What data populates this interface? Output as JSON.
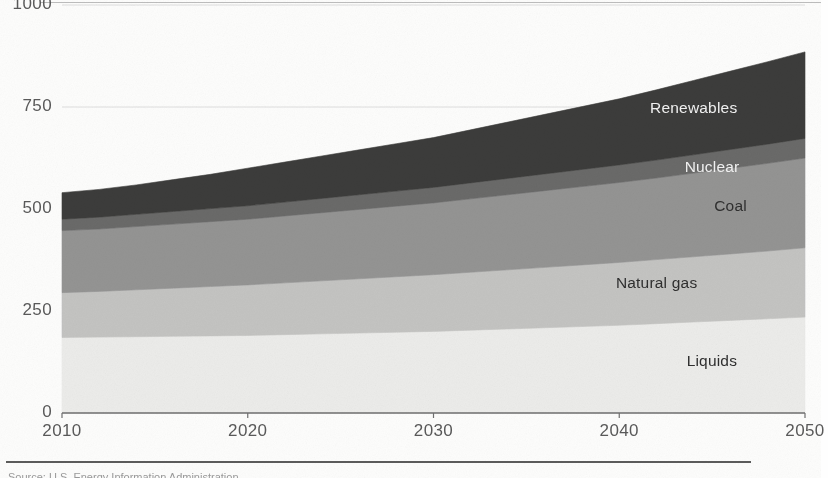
{
  "figure": {
    "source_note": "Source: U.S. Energy Information Administration",
    "background_color": "#fdfdfc"
  },
  "chart_data": {
    "type": "area",
    "stacked": true,
    "title": "",
    "subtitle": "",
    "xlabel": "",
    "ylabel": "",
    "xlim": [
      2010,
      2050
    ],
    "ylim": [
      0,
      1000
    ],
    "xticks": [
      2010,
      2020,
      2030,
      2040,
      2050
    ],
    "yticks": [
      0,
      250,
      500,
      750,
      1000
    ],
    "xtick_labels": [
      "2010",
      "2020",
      "2030",
      "2040",
      "2050"
    ],
    "ytick_labels": [
      "0",
      "250",
      "500",
      "750",
      "1000"
    ],
    "grid": "horizontal",
    "legend_position": "inline-right",
    "x": [
      2010,
      2012,
      2014,
      2016,
      2018,
      2020,
      2022,
      2024,
      2026,
      2028,
      2030,
      2032,
      2034,
      2036,
      2038,
      2040,
      2042,
      2044,
      2046,
      2048,
      2050
    ],
    "series": [
      {
        "name": "Liquids",
        "color": "#ececea",
        "label_color": "#2f2f2f",
        "values": [
          185,
          186,
          187,
          188,
          189,
          190,
          192,
          194,
          196,
          198,
          200,
          203,
          206,
          209,
          212,
          215,
          219,
          223,
          227,
          231,
          235
        ]
      },
      {
        "name": "Natural gas",
        "color": "#c4c4c2",
        "label_color": "#2f2f2f",
        "values": [
          110,
          112,
          115,
          118,
          121,
          124,
          127,
          130,
          133,
          136,
          139,
          142,
          145,
          148,
          151,
          154,
          157,
          160,
          163,
          166,
          170
        ]
      },
      {
        "name": "Coal",
        "color": "#949493",
        "label_color": "#2f2f2f",
        "values": [
          152,
          153,
          155,
          157,
          159,
          161,
          164,
          167,
          170,
          173,
          176,
          180,
          184,
          188,
          192,
          196,
          200,
          205,
          210,
          215,
          220
        ]
      },
      {
        "name": "Nuclear",
        "color": "#6a6a69",
        "label_color": "#f2f2f2",
        "values": [
          28,
          29,
          30,
          31,
          32,
          33,
          34,
          35,
          36,
          37,
          38,
          39,
          40,
          41,
          42,
          43,
          44,
          45,
          46,
          47,
          48
        ]
      },
      {
        "name": "Renewables",
        "color": "#3c3c3b",
        "label_color": "#f2f2f2",
        "values": [
          65,
          68,
          72,
          78,
          84,
          92,
          98,
          104,
          110,
          116,
          122,
          130,
          138,
          146,
          154,
          162,
          172,
          182,
          192,
          202,
          212
        ]
      }
    ],
    "totals": [
      540,
      548,
      559,
      572,
      585,
      600,
      615,
      630,
      645,
      660,
      675,
      694,
      713,
      732,
      751,
      770,
      792,
      815,
      838,
      861,
      885
    ],
    "series_label_positions": [
      {
        "name": "Renewables",
        "x_year": 2044,
        "y_value": 745
      },
      {
        "name": "Nuclear",
        "x_year": 2045,
        "y_value": 600
      },
      {
        "name": "Coal",
        "x_year": 2046,
        "y_value": 505
      },
      {
        "name": "Natural gas",
        "x_year": 2042,
        "y_value": 315
      },
      {
        "name": "Liquids",
        "x_year": 2045,
        "y_value": 125
      }
    ]
  }
}
